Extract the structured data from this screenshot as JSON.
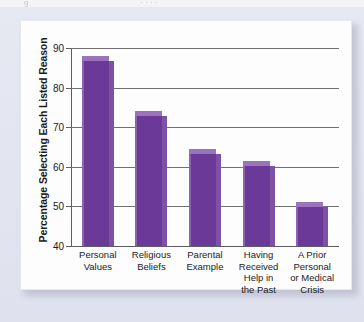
{
  "scan": {
    "top_fragment_left": "g",
    "top_fragment_right": "·   ·   ·   ·"
  },
  "chart_data": {
    "type": "bar",
    "title": "",
    "xlabel": "",
    "ylabel": "Percentage Selecting Each Listed Reason",
    "categories": [
      "Personal Values",
      "Religious Beliefs",
      "Parental Example",
      "Having Received Help in the Past",
      "A Prior Personal or Medical Crisis"
    ],
    "category_lines": [
      [
        "Personal",
        "Values"
      ],
      [
        "Religious",
        "Beliefs"
      ],
      [
        "Parental",
        "Example"
      ],
      [
        "Having",
        "Received",
        "Help in",
        "the Past"
      ],
      [
        "A Prior",
        "Personal",
        "or Medical",
        "Crisis"
      ]
    ],
    "values": [
      88,
      74,
      64.5,
      61.5,
      51
    ],
    "ylim": [
      40,
      90
    ],
    "yticks": [
      40,
      50,
      60,
      70,
      80,
      90
    ],
    "ytick_labels": [
      "40",
      "50",
      "60",
      "70",
      "80",
      "90"
    ],
    "grid": true,
    "legend": null,
    "bar_color": "#6b3a99",
    "bar_top_color": "#9a72bd",
    "bar_side_color": "#7d51a6"
  }
}
